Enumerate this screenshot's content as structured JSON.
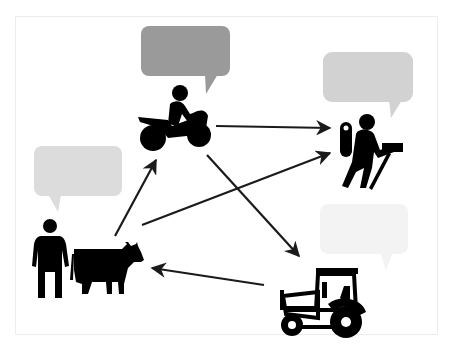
{
  "diagram": {
    "colors": {
      "background": "#ffffff",
      "frame_border": "#e6e6e6",
      "icon": "#000000",
      "arrow": "#1a1a1a",
      "bubble_rider": "#9a9a9a",
      "bubble_hiker": "#d2d2d2",
      "bubble_farmer": "#dcdcdc",
      "bubble_tractor": "#f3f3f3"
    },
    "nodes": [
      {
        "id": "rider",
        "icon": "motorcycle-rider-icon",
        "bubble_color": "#9a9a9a"
      },
      {
        "id": "hiker",
        "icon": "hiker-with-backpack-icon",
        "bubble_color": "#d2d2d2"
      },
      {
        "id": "farmer",
        "icon": "farmer-with-cow-icon",
        "bubble_color": "#dcdcdc"
      },
      {
        "id": "tractor",
        "icon": "tractor-icon",
        "bubble_color": "#f3f3f3"
      }
    ],
    "edges": [
      {
        "from": "rider",
        "to": "hiker"
      },
      {
        "from": "farmer",
        "to": "rider"
      },
      {
        "from": "farmer",
        "to": "hiker"
      },
      {
        "from": "rider",
        "to": "tractor"
      },
      {
        "from": "tractor",
        "to": "farmer"
      }
    ]
  }
}
